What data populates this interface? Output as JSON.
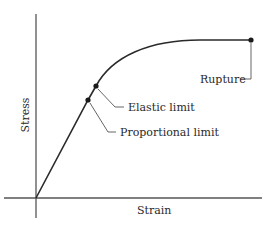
{
  "diagram": {
    "axes": {
      "x_label": "Strain",
      "y_label": "Stress"
    },
    "annotations": {
      "elastic_limit": "Elastic limit",
      "proportional_limit": "Proportional limit",
      "rupture": "Rupture"
    },
    "colors": {
      "line": "#2a2a2a",
      "axis": "#555555",
      "background": "#ffffff"
    }
  }
}
